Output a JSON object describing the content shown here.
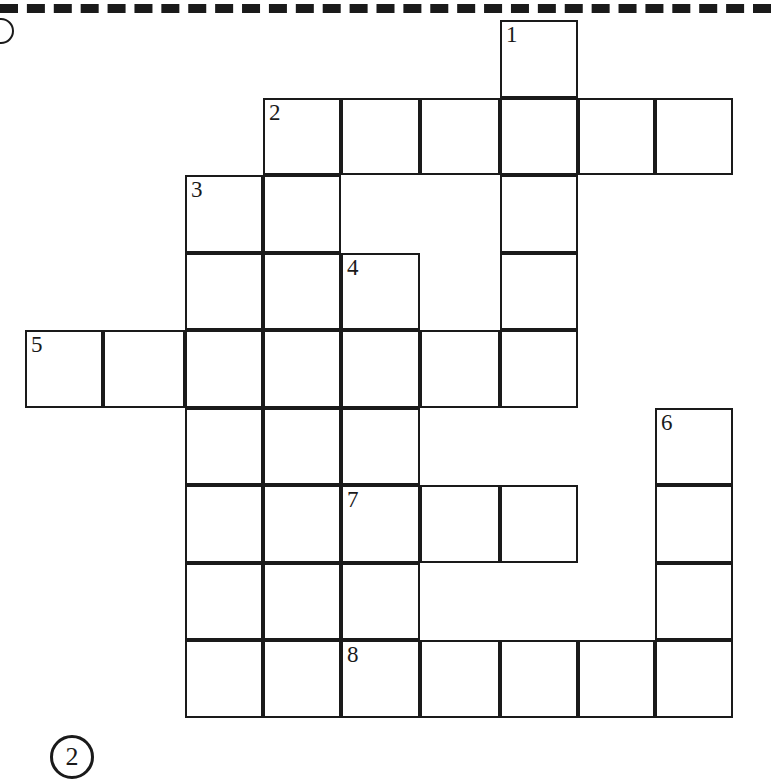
{
  "page": {
    "marker_number": "2",
    "background_color": "#ffffff",
    "ink_color": "#1a1a1a"
  },
  "decorations": {
    "cut_line_style": "dashed",
    "edge_arc": "binding-hole-arc"
  },
  "crossword": {
    "cell_size": 78,
    "origin_x": 25,
    "origin_y": 20,
    "columns_x": [
      25,
      103,
      185,
      263,
      341,
      420,
      500,
      578,
      655,
      733
    ],
    "rows_y": [
      20,
      98,
      175,
      253,
      330,
      408,
      485,
      563,
      640,
      718
    ],
    "clue_numbers": [
      "1",
      "2",
      "3",
      "4",
      "5",
      "6",
      "7",
      "8"
    ],
    "cells": [
      {
        "col": 6,
        "row": 0,
        "number": "1"
      },
      {
        "col": 3,
        "row": 1,
        "number": "2"
      },
      {
        "col": 4,
        "row": 1,
        "number": ""
      },
      {
        "col": 5,
        "row": 1,
        "number": ""
      },
      {
        "col": 6,
        "row": 1,
        "number": ""
      },
      {
        "col": 7,
        "row": 1,
        "number": ""
      },
      {
        "col": 8,
        "row": 1,
        "number": ""
      },
      {
        "col": 2,
        "row": 2,
        "number": "3"
      },
      {
        "col": 3,
        "row": 2,
        "number": ""
      },
      {
        "col": 6,
        "row": 2,
        "number": ""
      },
      {
        "col": 2,
        "row": 3,
        "number": ""
      },
      {
        "col": 3,
        "row": 3,
        "number": ""
      },
      {
        "col": 4,
        "row": 3,
        "number": "4"
      },
      {
        "col": 6,
        "row": 3,
        "number": ""
      },
      {
        "col": 0,
        "row": 4,
        "number": "5"
      },
      {
        "col": 1,
        "row": 4,
        "number": ""
      },
      {
        "col": 2,
        "row": 4,
        "number": ""
      },
      {
        "col": 3,
        "row": 4,
        "number": ""
      },
      {
        "col": 4,
        "row": 4,
        "number": ""
      },
      {
        "col": 5,
        "row": 4,
        "number": ""
      },
      {
        "col": 6,
        "row": 4,
        "number": ""
      },
      {
        "col": 2,
        "row": 5,
        "number": ""
      },
      {
        "col": 3,
        "row": 5,
        "number": ""
      },
      {
        "col": 4,
        "row": 5,
        "number": ""
      },
      {
        "col": 8,
        "row": 5,
        "number": "6"
      },
      {
        "col": 2,
        "row": 6,
        "number": ""
      },
      {
        "col": 3,
        "row": 6,
        "number": ""
      },
      {
        "col": 4,
        "row": 6,
        "number": "7"
      },
      {
        "col": 5,
        "row": 6,
        "number": ""
      },
      {
        "col": 6,
        "row": 6,
        "number": ""
      },
      {
        "col": 8,
        "row": 6,
        "number": ""
      },
      {
        "col": 2,
        "row": 7,
        "number": ""
      },
      {
        "col": 3,
        "row": 7,
        "number": ""
      },
      {
        "col": 4,
        "row": 7,
        "number": ""
      },
      {
        "col": 8,
        "row": 7,
        "number": ""
      },
      {
        "col": 2,
        "row": 8,
        "number": ""
      },
      {
        "col": 3,
        "row": 8,
        "number": ""
      },
      {
        "col": 4,
        "row": 8,
        "number": "8"
      },
      {
        "col": 5,
        "row": 8,
        "number": ""
      },
      {
        "col": 6,
        "row": 8,
        "number": ""
      },
      {
        "col": 7,
        "row": 8,
        "number": ""
      },
      {
        "col": 8,
        "row": 8,
        "number": ""
      }
    ]
  }
}
